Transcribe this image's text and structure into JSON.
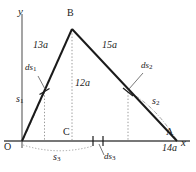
{
  "figure": {
    "type": "geometry-diagram",
    "axes": {
      "x_label": "x",
      "y_label": "y",
      "origin_label": "O"
    },
    "vertices": [
      {
        "name": "O",
        "label": "O",
        "x": 22,
        "y": 141
      },
      {
        "name": "B",
        "label": "B",
        "x": 72,
        "y": 28
      },
      {
        "name": "A",
        "label": "A",
        "x": 177,
        "y": 141
      },
      {
        "name": "C",
        "label": "C",
        "x": 72,
        "y": 141
      }
    ],
    "side_labels": [
      {
        "name": "OB",
        "text": "13a"
      },
      {
        "name": "BA",
        "text": "15a"
      },
      {
        "name": "BC",
        "text": "12a"
      },
      {
        "name": "OA",
        "text": "14a"
      }
    ],
    "arc_labels": [
      {
        "name": "s1",
        "base": "s",
        "sub": "1"
      },
      {
        "name": "s2",
        "base": "s",
        "sub": "2"
      },
      {
        "name": "s3",
        "base": "s",
        "sub": "3"
      }
    ],
    "differential_labels": [
      {
        "name": "ds1",
        "base": "ds",
        "sub": "1"
      },
      {
        "name": "ds2",
        "base": "ds",
        "sub": "2"
      },
      {
        "name": "ds3",
        "base": "ds",
        "sub": "3"
      }
    ],
    "colors": {
      "stroke": "#1a1a1a",
      "axis": "#4d4d4d",
      "dotted": "#8c8c8c",
      "background": "#ffffff"
    }
  }
}
